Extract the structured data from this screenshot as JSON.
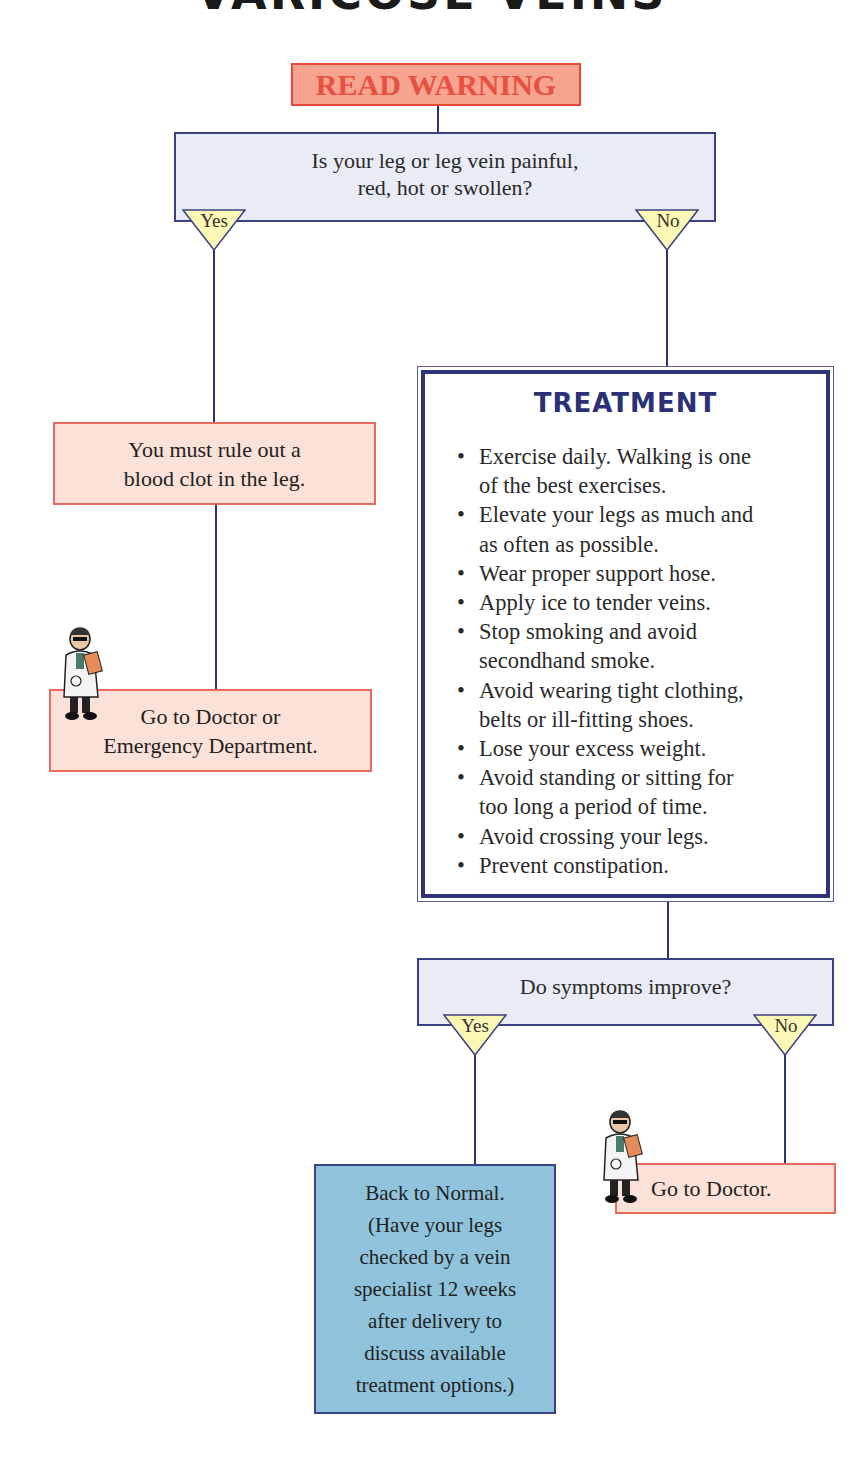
{
  "title": "VARICOSE VEINS",
  "colors": {
    "warning_fill": "#f6a48f",
    "warning_text": "#e8503f",
    "question_fill": "#e9ebf5",
    "line_color": "#2d3270",
    "action_fill": "#fbe1d7",
    "action_border": "#e86a5c",
    "branch_fill": "#fbf7b4",
    "outcome_fill": "#8fc3dc",
    "treatment_title": "#2b3176"
  },
  "flowchart": {
    "start": {
      "label": "READ WARNING"
    },
    "question1": {
      "line1": "Is your leg or leg vein painful,",
      "line2": "red, hot or swollen?",
      "yes_label": "Yes",
      "no_label": "No"
    },
    "yes_branch": {
      "step1": {
        "line1": "You must rule out a",
        "line2": "blood clot in the leg."
      },
      "step2": {
        "line1": "Go to Doctor or",
        "line2": "Emergency Department.",
        "icon": "doctor-icon"
      }
    },
    "treatment": {
      "title": "TREATMENT",
      "items": [
        {
          "line1": "Exercise daily. Walking is one",
          "line2": "of the best exercises."
        },
        {
          "line1": "Elevate your legs as much and",
          "line2": "as often as possible."
        },
        {
          "line1": "Wear proper support hose."
        },
        {
          "line1": "Apply ice to tender veins."
        },
        {
          "line1": "Stop smoking and avoid",
          "line2": "secondhand smoke."
        },
        {
          "line1": "Avoid wearing tight clothing,",
          "line2": "belts or ill-fitting shoes."
        },
        {
          "line1": "Lose your excess weight."
        },
        {
          "line1": "Avoid standing or sitting for",
          "line2": "too long a period of time."
        },
        {
          "line1": "Avoid crossing your legs."
        },
        {
          "line1": "Prevent constipation."
        }
      ]
    },
    "question2": {
      "label": "Do symptoms improve?",
      "yes_label": "Yes",
      "no_label": "No"
    },
    "outcome_yes": {
      "lines": [
        "Back to Normal.",
        "(Have your legs",
        "checked by a vein",
        "specialist 12 weeks",
        "after delivery to",
        "discuss available",
        "treatment options.)"
      ]
    },
    "outcome_no": {
      "label": "Go to Doctor.",
      "icon": "doctor-icon"
    }
  }
}
